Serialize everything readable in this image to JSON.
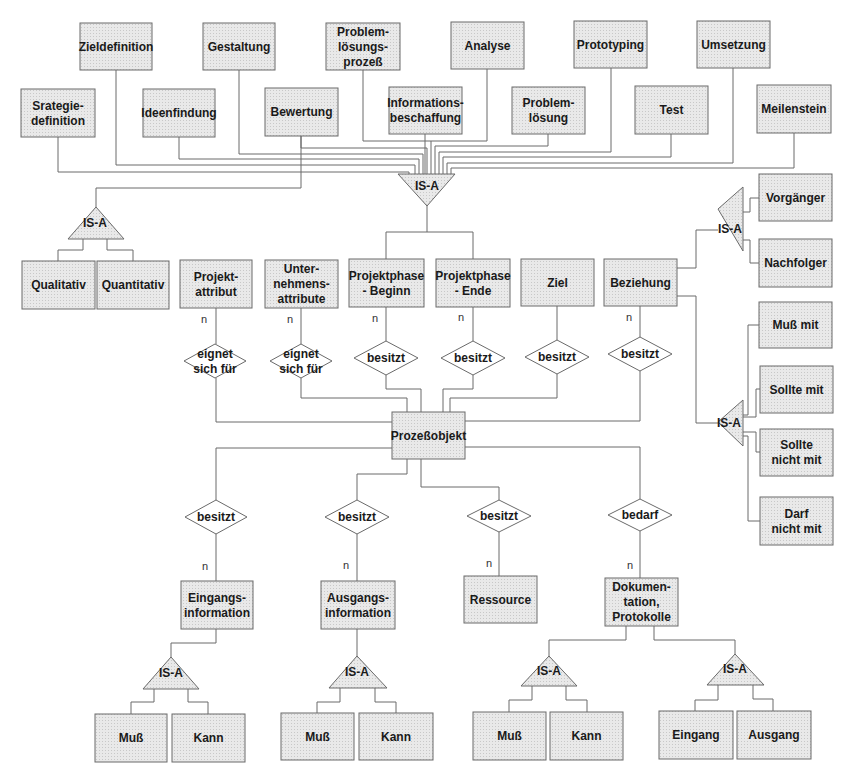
{
  "diagram": {
    "type": "entity-relationship",
    "colors": {
      "entity_fill": "#e6e6e6",
      "isa_fill": "#dcdcdc",
      "relation_fill": "#ffffff",
      "stroke": "#6a6a6a",
      "text": "#1a1a1a"
    },
    "isa_label": "IS-A",
    "cardinality": "n",
    "entities": [
      {
        "id": "zieldefinition",
        "lines": [
          "Zieldefinition"
        ],
        "x": 80,
        "y": 23,
        "w": 72,
        "h": 47
      },
      {
        "id": "gestaltung",
        "lines": [
          "Gestaltung"
        ],
        "x": 203,
        "y": 23,
        "w": 72,
        "h": 47
      },
      {
        "id": "problemloesungsprozess",
        "lines": [
          "Problem-",
          "lösungs-",
          "prozeß"
        ],
        "x": 326,
        "y": 23,
        "w": 74,
        "h": 47
      },
      {
        "id": "analyse",
        "lines": [
          "Analyse"
        ],
        "x": 451,
        "y": 22,
        "w": 73,
        "h": 47
      },
      {
        "id": "prototyping",
        "lines": [
          "Prototyping"
        ],
        "x": 574,
        "y": 21,
        "w": 73,
        "h": 47
      },
      {
        "id": "umsetzung",
        "lines": [
          "Umsetzung"
        ],
        "x": 697,
        "y": 21,
        "w": 73,
        "h": 47
      },
      {
        "id": "strategiedefinition",
        "lines": [
          "Srategie-",
          "definition"
        ],
        "x": 21,
        "y": 89,
        "w": 74,
        "h": 48
      },
      {
        "id": "ideenfindung",
        "lines": [
          "Ideenfindung"
        ],
        "x": 143,
        "y": 89,
        "w": 72,
        "h": 48
      },
      {
        "id": "bewertung",
        "lines": [
          "Bewertung"
        ],
        "x": 265,
        "y": 88,
        "w": 73,
        "h": 48
      },
      {
        "id": "informationsbeschaffung",
        "lines": [
          "Informations-",
          "beschaffung"
        ],
        "x": 389,
        "y": 87,
        "w": 73,
        "h": 47
      },
      {
        "id": "problemloesung",
        "lines": [
          "Problem-",
          "lösung"
        ],
        "x": 512,
        "y": 87,
        "w": 73,
        "h": 47
      },
      {
        "id": "test",
        "lines": [
          "Test"
        ],
        "x": 635,
        "y": 86,
        "w": 73,
        "h": 48
      },
      {
        "id": "meilenstein",
        "lines": [
          "Meilenstein"
        ],
        "x": 757,
        "y": 85,
        "w": 74,
        "h": 48
      },
      {
        "id": "vorgaenger",
        "lines": [
          "Vorgänger"
        ],
        "x": 759,
        "y": 174,
        "w": 73,
        "h": 47
      },
      {
        "id": "nachfolger",
        "lines": [
          "Nachfolger"
        ],
        "x": 759,
        "y": 239,
        "w": 73,
        "h": 48
      },
      {
        "id": "qualitativ",
        "lines": [
          "Qualitativ"
        ],
        "x": 22,
        "y": 261,
        "w": 73,
        "h": 48
      },
      {
        "id": "quantitativ",
        "lines": [
          "Quantitativ"
        ],
        "x": 97,
        "y": 261,
        "w": 72,
        "h": 48
      },
      {
        "id": "projektattribut",
        "lines": [
          "Projekt-",
          "attribut"
        ],
        "x": 180,
        "y": 260,
        "w": 72,
        "h": 48
      },
      {
        "id": "unternehmensattribute",
        "lines": [
          "Unter-",
          "nehmens-",
          "attribute"
        ],
        "x": 265,
        "y": 260,
        "w": 73,
        "h": 48
      },
      {
        "id": "projektphase_beginn",
        "lines": [
          "Projektphase",
          "- Beginn"
        ],
        "x": 349,
        "y": 259,
        "w": 75,
        "h": 48
      },
      {
        "id": "projektphase_ende",
        "lines": [
          "Projektphase",
          "- Ende"
        ],
        "x": 436,
        "y": 259,
        "w": 74,
        "h": 48
      },
      {
        "id": "ziel",
        "lines": [
          "Ziel"
        ],
        "x": 521,
        "y": 259,
        "w": 73,
        "h": 47
      },
      {
        "id": "beziehung",
        "lines": [
          "Beziehung"
        ],
        "x": 604,
        "y": 259,
        "w": 73,
        "h": 47
      },
      {
        "id": "muss_mit",
        "lines": [
          "Muß mit"
        ],
        "x": 759,
        "y": 302,
        "w": 73,
        "h": 46
      },
      {
        "id": "sollte_mit",
        "lines": [
          "Sollte mit"
        ],
        "x": 760,
        "y": 366,
        "w": 73,
        "h": 47
      },
      {
        "id": "sollte_nicht_mit",
        "lines": [
          "Sollte",
          "nicht mit"
        ],
        "x": 760,
        "y": 429,
        "w": 73,
        "h": 47
      },
      {
        "id": "darf_nicht_mit",
        "lines": [
          "Darf",
          "nicht mit"
        ],
        "x": 760,
        "y": 497,
        "w": 73,
        "h": 48
      },
      {
        "id": "prozessobjekt",
        "lines": [
          "Prozeßobjekt"
        ],
        "x": 392,
        "y": 412,
        "w": 73,
        "h": 47
      },
      {
        "id": "eingangsinformation",
        "lines": [
          "Eingangs-",
          "information"
        ],
        "x": 181,
        "y": 581,
        "w": 72,
        "h": 48
      },
      {
        "id": "ausgangsinformation",
        "lines": [
          "Ausgangs-",
          "information"
        ],
        "x": 321,
        "y": 581,
        "w": 74,
        "h": 48
      },
      {
        "id": "ressource",
        "lines": [
          "Ressource"
        ],
        "x": 464,
        "y": 576,
        "w": 73,
        "h": 47
      },
      {
        "id": "dokumentation",
        "lines": [
          "Dokumen-",
          "tation,",
          "Protokolle"
        ],
        "x": 605,
        "y": 578,
        "w": 73,
        "h": 48
      },
      {
        "id": "muss_ein",
        "lines": [
          "Muß"
        ],
        "x": 95,
        "y": 714,
        "w": 72,
        "h": 48
      },
      {
        "id": "kann_ein",
        "lines": [
          "Kann"
        ],
        "x": 172,
        "y": 714,
        "w": 73,
        "h": 48
      },
      {
        "id": "muss_aus",
        "lines": [
          "Muß"
        ],
        "x": 281,
        "y": 713,
        "w": 73,
        "h": 47
      },
      {
        "id": "kann_aus",
        "lines": [
          "Kann"
        ],
        "x": 359,
        "y": 713,
        "w": 74,
        "h": 47
      },
      {
        "id": "muss_dok",
        "lines": [
          "Muß"
        ],
        "x": 473,
        "y": 712,
        "w": 73,
        "h": 48
      },
      {
        "id": "kann_dok",
        "lines": [
          "Kann"
        ],
        "x": 550,
        "y": 712,
        "w": 73,
        "h": 48
      },
      {
        "id": "eingang",
        "lines": [
          "Eingang"
        ],
        "x": 659,
        "y": 711,
        "w": 74,
        "h": 48
      },
      {
        "id": "ausgang",
        "lines": [
          "Ausgang"
        ],
        "x": 737,
        "y": 711,
        "w": 74,
        "h": 48
      }
    ],
    "relations": [
      {
        "id": "rel_eignet_1",
        "lines": [
          "eignet",
          "sich für"
        ],
        "cx": 215,
        "cy": 361,
        "hw": 31,
        "hh": 17
      },
      {
        "id": "rel_eignet_2",
        "lines": [
          "eignet",
          "sich für"
        ],
        "cx": 301,
        "cy": 361,
        "hw": 31,
        "hh": 17
      },
      {
        "id": "rel_besitzt_beginn",
        "lines": [
          "besitzt"
        ],
        "cx": 386,
        "cy": 358,
        "hw": 32,
        "hh": 17
      },
      {
        "id": "rel_besitzt_ende",
        "lines": [
          "besitzt"
        ],
        "cx": 473,
        "cy": 358,
        "hw": 32,
        "hh": 17
      },
      {
        "id": "rel_besitzt_ziel",
        "lines": [
          "besitzt"
        ],
        "cx": 557,
        "cy": 357,
        "hw": 32,
        "hh": 17
      },
      {
        "id": "rel_besitzt_bez",
        "lines": [
          "besitzt"
        ],
        "cx": 640,
        "cy": 354,
        "hw": 32,
        "hh": 17
      },
      {
        "id": "rel_besitzt_ein",
        "lines": [
          "besitzt"
        ],
        "cx": 216,
        "cy": 517,
        "hw": 31,
        "hh": 17
      },
      {
        "id": "rel_besitzt_aus",
        "lines": [
          "besitzt"
        ],
        "cx": 357,
        "cy": 517,
        "hw": 32,
        "hh": 17
      },
      {
        "id": "rel_besitzt_res",
        "lines": [
          "besitzt"
        ],
        "cx": 499,
        "cy": 516,
        "hw": 32,
        "hh": 16
      },
      {
        "id": "rel_bedarf",
        "lines": [
          "bedarf"
        ],
        "cx": 640,
        "cy": 515,
        "hw": 32,
        "hh": 16
      }
    ],
    "isa": [
      {
        "id": "isa_top",
        "dir": "down",
        "pts": "398,174 455,174 427,206",
        "tx": 427,
        "ty": 190
      },
      {
        "id": "isa_bewertung",
        "dir": "up",
        "pts": "68,239 96,207 124,239",
        "tx": 95,
        "ty": 227
      },
      {
        "id": "isa_beziehung",
        "dir": "left",
        "pts": "718,209 743,187 743,251",
        "tx": 730,
        "ty": 233
      },
      {
        "id": "isa_muss",
        "dir": "left",
        "pts": "718,422 743,400 743,446",
        "tx": 729,
        "ty": 427
      },
      {
        "id": "isa_ein",
        "dir": "up",
        "pts": "143,689 171,657 199,689",
        "tx": 171,
        "ty": 677
      },
      {
        "id": "isa_aus",
        "dir": "up",
        "pts": "329,688 357,656 387,688",
        "tx": 357,
        "ty": 676
      },
      {
        "id": "isa_dok1",
        "dir": "up",
        "pts": "521,686 549,656 577,686",
        "tx": 549,
        "ty": 675
      },
      {
        "id": "isa_dok2",
        "dir": "up",
        "pts": "707,685 735,654 764,685",
        "tx": 735,
        "ty": 673
      }
    ],
    "cardinality_labels": [
      {
        "x": 204,
        "y": 323
      },
      {
        "x": 290,
        "y": 323
      },
      {
        "x": 375,
        "y": 322
      },
      {
        "x": 461,
        "y": 321
      },
      {
        "x": 629,
        "y": 321
      },
      {
        "x": 205,
        "y": 570
      },
      {
        "x": 346,
        "y": 569
      },
      {
        "x": 489,
        "y": 567
      },
      {
        "x": 630,
        "y": 569
      }
    ],
    "connectors": [
      "M116,70 V165 H415 V176",
      "M239,70 V154 H423 V176",
      "M363,70 V141 H431 V176",
      "M487,69 V141 H431",
      "M611,68 V152 H439 V176",
      "M733,68 V163 H447 V176",
      "M58,137 V172 H409 V176",
      "M179,137 V159 H419 V176",
      "M301,136 V148 H427 V176",
      "M425,134 V176",
      "M548,134 V146 H435 V176",
      "M671,134 V157 H443 V176",
      "M794,133 V168 H451 V176",
      "M301,136 V188 H96 V207",
      "M427,206 V232 H386 V259",
      "M427,232 H473 V259",
      "M83,239 V250 H58 V261",
      "M107,239 V250 H133 V261",
      "M216,308 V344",
      "M301,308 V344",
      "M386,307 V341",
      "M473,307 V341",
      "M557,306 V340",
      "M640,306 V337",
      "M216,378 V422 H392",
      "M301,378 V398 H407 V412",
      "M386,375 V389 H421 V412",
      "M473,375 V389 H443 V412",
      "M557,374 V398 H450 V412",
      "M640,371 V421 H465",
      "M677,268 H696 V230 H718",
      "M743,212 H750 V198 H759",
      "M743,240 H750 V263 H759",
      "M677,296 H696 V423 H718",
      "M743,415 H748 V325 H759",
      "M743,417 H756 V389 H760",
      "M743,432 H756 V452 H760",
      "M743,436 H748 V521 H760",
      "M392,448 H216 V500",
      "M407,459 V474 H357 V500",
      "M421,459 V487 H499 V500",
      "M465,447 H640 V499",
      "M216,534 V581",
      "M357,534 V581",
      "M499,532 V576",
      "M640,531 V578",
      "M216,629 V643 H171 V657",
      "M357,629 V656",
      "M626,626 V640 H549 V656",
      "M654,626 V640 H735 V654",
      "M154,689 V702 H131 V714",
      "M188,689 V702 H208 V714",
      "M340,688 V702 H317 V713",
      "M375,688 V702 H396 V713",
      "M532,686 V700 H509 V712",
      "M566,686 V700 H587 V712",
      "M718,685 V700 H695 V711",
      "M753,685 V699 H773 V711"
    ]
  }
}
